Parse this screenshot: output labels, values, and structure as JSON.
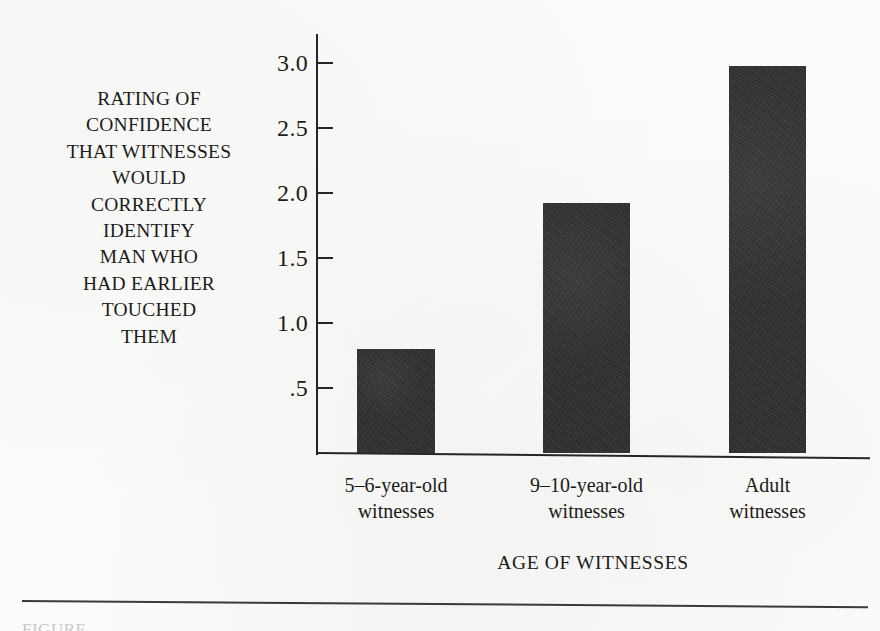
{
  "figure": {
    "background_color": "#fbfbf9",
    "ink_color": "#1b1b1b",
    "bar_color": "#2e2e2e",
    "axis_color": "#262626",
    "caption_sliver": "FIGURE"
  },
  "y_caption_lines": [
    "RATING OF",
    "CONFIDENCE",
    "THAT WITNESSES",
    "WOULD",
    "CORRECTLY",
    "IDENTIFY",
    "MAN WHO",
    "HAD EARLIER",
    "TOUCHED",
    "THEM"
  ],
  "chart_data": {
    "type": "bar",
    "title": "",
    "subtitle": "",
    "xlabel": "AGE OF WITNESSES",
    "ylabel": "RATING OF CONFIDENCE THAT WITNESSES WOULD CORRECTLY IDENTIFY MAN WHO HAD EARLIER TOUCHED THEM",
    "categories": [
      "5–6-year-old witnesses",
      "9–10-year-old witnesses",
      "Adult witnesses"
    ],
    "category_lines": [
      [
        "5–6-year-old",
        "witnesses"
      ],
      [
        "9–10-year-old",
        "witnesses"
      ],
      [
        "Adult",
        "witnesses"
      ]
    ],
    "values": [
      0.8,
      1.92,
      2.98
    ],
    "ylim": [
      0,
      3.1
    ],
    "ytick_values": [
      0.5,
      1.0,
      1.5,
      2.0,
      2.5,
      3.0
    ],
    "ytick_labels": [
      ".5",
      "1.0",
      "1.5",
      "2.0",
      "2.5",
      "3.0"
    ],
    "grid": false,
    "legend": false,
    "legend_position": "none"
  }
}
